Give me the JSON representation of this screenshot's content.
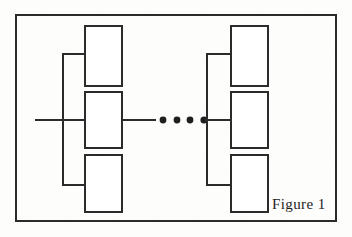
{
  "figure": {
    "caption": "Figure 1",
    "caption_position": "bottom-right",
    "background_color": "#fdfdfc",
    "ink_color": "#2b2b2b",
    "frame": {
      "name": "figure-border",
      "x": 15,
      "y": 14,
      "width": 322,
      "height": 208,
      "stroke_width": 2
    },
    "line_style": {
      "stroke": "#2b2b2b",
      "stroke_width": 2,
      "box_stroke_width": 2
    },
    "input_line": {
      "name": "input-signal-line",
      "x1": 35,
      "y1": 120,
      "x2": 85,
      "y2": 120
    },
    "left_group": {
      "label": "left-block-group",
      "bus_x": 63,
      "bus_top_y": 54,
      "bus_bottom_y": 185,
      "boxes": [
        {
          "id": "left-box-top",
          "x": 85,
          "y": 26,
          "width": 37,
          "height": 60,
          "stub_y": 54
        },
        {
          "id": "left-box-middle",
          "x": 85,
          "y": 92,
          "width": 37,
          "height": 56,
          "stub_y": 120
        },
        {
          "id": "left-box-bottom",
          "x": 85,
          "y": 155,
          "width": 37,
          "height": 57,
          "stub_y": 185
        }
      ]
    },
    "right_group": {
      "label": "right-block-group",
      "bus_x": 207,
      "bus_top_y": 54,
      "bus_bottom_y": 185,
      "boxes": [
        {
          "id": "right-box-top",
          "x": 231,
          "y": 26,
          "width": 37,
          "height": 60,
          "stub_y": 54
        },
        {
          "id": "right-box-middle",
          "x": 231,
          "y": 92,
          "width": 37,
          "height": 56,
          "stub_y": 120
        },
        {
          "id": "right-box-bottom",
          "x": 231,
          "y": 155,
          "width": 37,
          "height": 57,
          "stub_y": 185
        }
      ]
    },
    "ellipsis": {
      "name": "continuation-ellipsis",
      "count": 4,
      "radius": 3.4,
      "cy": 120,
      "cx_values": [
        163,
        177,
        190,
        204
      ],
      "segment_left": {
        "x1": 122,
        "y1": 120,
        "x2": 156,
        "y2": 120
      },
      "segment_right": {
        "x1": 207,
        "y1": 120,
        "x2": 231,
        "y2": 120
      }
    },
    "caption_anchor": {
      "x": 272,
      "y": 209
    }
  }
}
